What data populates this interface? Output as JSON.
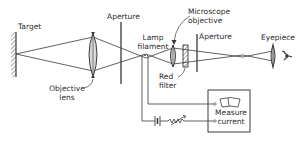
{
  "diagram": {
    "type": "optical pyrometer schematic",
    "colors": {
      "line": "#3a3a3a",
      "background": "#ffffff",
      "lens_fill": "#d8d8d8"
    },
    "labels": {
      "target": "Target",
      "aperture_1": "Aperture",
      "objective_lens_line1": "Objective",
      "objective_lens_line2": "lens",
      "lamp_filament_line1": "Lamp",
      "lamp_filament_line2": "filament",
      "microscope_objective_line1": "Microscope",
      "microscope_objective_line2": "objective",
      "aperture_2": "Aperture",
      "eyepiece": "Eyepiece",
      "red_filter_line1": "Red",
      "red_filter_line2": "filter",
      "measure_current_line1": "Measure",
      "measure_current_line2": "current"
    },
    "components": [
      {
        "name": "Target",
        "type": "surface"
      },
      {
        "name": "Objective lens",
        "type": "convex lens"
      },
      {
        "name": "Aperture",
        "type": "stop"
      },
      {
        "name": "Lamp filament",
        "type": "filament"
      },
      {
        "name": "Microscope objective",
        "type": "convex lens"
      },
      {
        "name": "Red filter",
        "type": "filter"
      },
      {
        "name": "Aperture",
        "type": "stop"
      },
      {
        "name": "Eyepiece",
        "type": "convex lens"
      },
      {
        "name": "Eye",
        "type": "observer"
      },
      {
        "name": "Measure current",
        "type": "ammeter"
      },
      {
        "name": "Battery",
        "type": "power source"
      },
      {
        "name": "Rheostat",
        "type": "variable resistor"
      }
    ]
  }
}
